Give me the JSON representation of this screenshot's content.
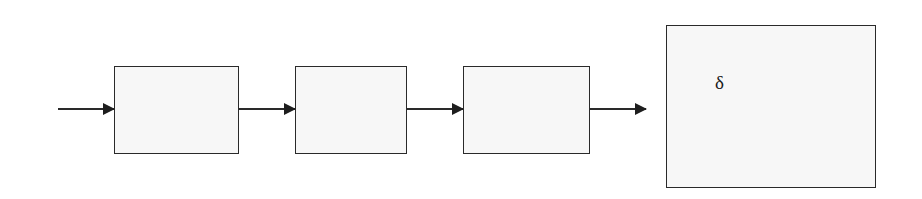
{
  "diagram": {
    "type": "block-chain",
    "line_color": "#2a2a2a",
    "box_fill": "#f7f7f7",
    "input_arrow": {
      "x1": 58,
      "x2": 114,
      "y": 109
    },
    "blocks": [
      {
        "id": "block-1",
        "x": 114,
        "y": 66,
        "w": 125,
        "h": 88,
        "label": ""
      },
      {
        "id": "block-2",
        "x": 295,
        "y": 66,
        "w": 112,
        "h": 88,
        "label": ""
      },
      {
        "id": "block-3",
        "x": 463,
        "y": 66,
        "w": 127,
        "h": 88,
        "label": ""
      },
      {
        "id": "block-4",
        "x": 666,
        "y": 25,
        "w": 210,
        "h": 163,
        "label": "δ"
      }
    ],
    "connectors": [
      {
        "from": "block-1",
        "to": "block-2",
        "x1": 239,
        "x2": 295,
        "y": 109
      },
      {
        "from": "block-2",
        "to": "block-3",
        "x1": 407,
        "x2": 463,
        "y": 109
      },
      {
        "from": "block-3",
        "to": "block-4",
        "x1": 590,
        "x2": 646,
        "y": 109
      }
    ],
    "delta_label": {
      "text": "δ",
      "x": 715,
      "y": 72
    }
  }
}
